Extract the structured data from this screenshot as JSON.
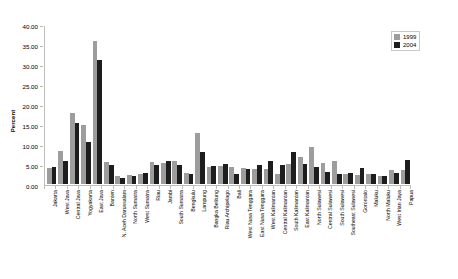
{
  "chart_data": {
    "type": "bar",
    "title": "",
    "xlabel": "",
    "ylabel": "Percent",
    "ylim": [
      0,
      40
    ],
    "ytick_step": 5,
    "ytick_labels": [
      "0.00",
      "5.00",
      "10.00",
      "15.00",
      "20.00",
      "25.00",
      "30.00",
      "35.00",
      "40.00"
    ],
    "grid": false,
    "legend_position": "top-right",
    "categories": [
      "Jakarta",
      "West Java",
      "Central Java",
      "Yogyakarta",
      "East Java",
      "Banten",
      "N. Aceh Darussalam",
      "North Sumatra",
      "West Sumatra",
      "Riau",
      "Jambi",
      "South Sumatra",
      "Bengkulu",
      "Lampung",
      "Bangka Belitung",
      "Riau Archipelago",
      "Bali",
      "West Nusa Tenggara",
      "East Nusa Tenggara",
      "West Kalimantan",
      "Central Kalimantan",
      "South Kalimantan",
      "East Kalimantan",
      "North Sulawesi",
      "Central Sulawesi",
      "South Sulawesi",
      "Southeast Sulawesi",
      "Gorontalo",
      "Maluku",
      "North Maluku",
      "West Irian Jaya",
      "Papua"
    ],
    "series": [
      {
        "name": "1999",
        "color": "#9d9d9d",
        "values": [
          4.1,
          8.2,
          17.8,
          14.9,
          36.1,
          5.5,
          2.0,
          2.3,
          2.5,
          5.6,
          5.2,
          5.9,
          2.8,
          12.8,
          4.4,
          4.6,
          4.3,
          4.0,
          3.9,
          3.9,
          2.4,
          5.1,
          6.9,
          9.3,
          5.4,
          5.9,
          2.5,
          2.3,
          2.4,
          2.0,
          3.5,
          3.5
        ]
      },
      {
        "name": "2004",
        "color": "#1d1d1d",
        "values": [
          4.2,
          5.8,
          15.3,
          10.6,
          31.3,
          4.9,
          1.6,
          2.0,
          2.7,
          4.9,
          5.7,
          4.9,
          2.6,
          8.1,
          4.6,
          5.0,
          2.6,
          3.8,
          4.9,
          5.7,
          4.9,
          8.0,
          5.1,
          4.2,
          2.9,
          2.6,
          2.7,
          4.1,
          2.6,
          2.0,
          2.8,
          6.0
        ]
      }
    ]
  },
  "legend": {
    "entries": [
      {
        "label": "1999"
      },
      {
        "label": "2004"
      }
    ]
  }
}
